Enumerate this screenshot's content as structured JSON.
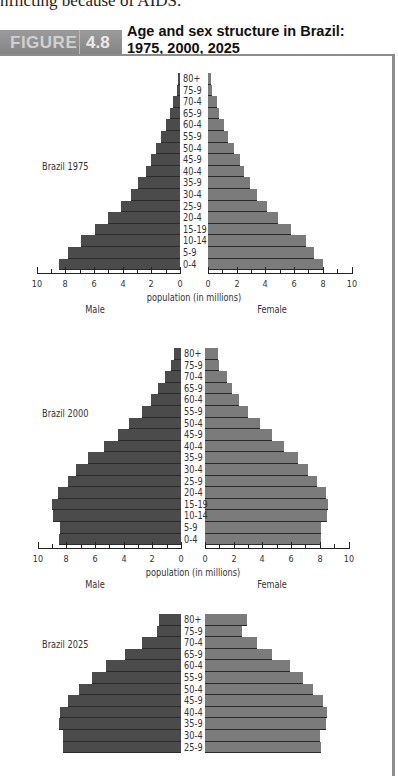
{
  "page": {
    "preceding_text": "nflicting because of AIDS."
  },
  "figure": {
    "tab_word": "FIGURE",
    "tab_number": "4.8",
    "title_line1": "Age and sex structure in Brazil:",
    "title_line2": "1975, 2000, 2025",
    "colors": {
      "male": "#4b4b4b",
      "female": "#7b7b7b",
      "frame": "#8c8c8c",
      "tab": "#8f8f8f"
    }
  },
  "axis": {
    "title": "population (in millions)",
    "male_label": "Male",
    "female_label": "Female",
    "male_ticks": [
      "10",
      "8",
      "6",
      "4",
      "2",
      "0"
    ],
    "female_ticks": [
      "0",
      "2",
      "4",
      "6",
      "8",
      "10"
    ]
  },
  "chart_data": [
    {
      "type": "bar",
      "orientation": "horizontal-population-pyramid",
      "title": "Brazil 1975",
      "xlabel": "population (in millions)",
      "ylabel": "age group",
      "xlim": [
        0,
        10
      ],
      "categories": [
        "80+",
        "75-9",
        "70-4",
        "65-9",
        "60-4",
        "55-9",
        "50-4",
        "45-9",
        "40-4",
        "35-9",
        "30-4",
        "25-9",
        "20-4",
        "15-19",
        "10-14",
        "5-9",
        "0-4"
      ],
      "series": [
        {
          "name": "Male",
          "values": [
            0.15,
            0.2,
            0.5,
            0.7,
            1.0,
            1.3,
            1.7,
            2.0,
            2.4,
            2.9,
            3.4,
            4.1,
            5.0,
            5.9,
            6.9,
            7.8,
            8.4
          ]
        },
        {
          "name": "Female",
          "values": [
            0.2,
            0.3,
            0.6,
            0.8,
            1.1,
            1.4,
            1.8,
            2.2,
            2.5,
            2.9,
            3.4,
            4.1,
            4.9,
            5.8,
            6.8,
            7.4,
            8.0
          ]
        }
      ]
    },
    {
      "type": "bar",
      "orientation": "horizontal-population-pyramid",
      "title": "Brazil 2000",
      "xlabel": "population (in millions)",
      "ylabel": "age group",
      "xlim": [
        0,
        10
      ],
      "categories": [
        "80+",
        "75-9",
        "70-4",
        "65-9",
        "60-4",
        "55-9",
        "50-4",
        "45-9",
        "40-4",
        "35-9",
        "30-4",
        "25-9",
        "20-4",
        "15-19",
        "10-14",
        "5-9",
        "0-4"
      ],
      "series": [
        {
          "name": "Male",
          "values": [
            0.5,
            0.7,
            1.1,
            1.6,
            2.1,
            2.7,
            3.6,
            4.4,
            5.4,
            6.5,
            7.3,
            7.9,
            8.6,
            9.0,
            8.9,
            8.4,
            8.5
          ]
        },
        {
          "name": "Female",
          "values": [
            0.9,
            1.0,
            1.5,
            1.9,
            2.4,
            3.0,
            3.8,
            4.7,
            5.5,
            6.5,
            7.2,
            7.8,
            8.4,
            8.6,
            8.5,
            8.1,
            8.1
          ]
        }
      ]
    },
    {
      "type": "bar",
      "orientation": "horizontal-population-pyramid",
      "title": "Brazil 2025",
      "xlabel": "population (in millions)",
      "ylabel": "age group",
      "xlim": [
        0,
        10
      ],
      "note": "visible portion only; rows below 25-9 are cut off",
      "categories": [
        "80+",
        "75-9",
        "70-4",
        "65-9",
        "60-4",
        "55-9",
        "50-4",
        "45-9",
        "40-4",
        "35-9",
        "30-4",
        "25-9"
      ],
      "series": [
        {
          "name": "Male",
          "values": [
            1.5,
            1.7,
            2.7,
            3.9,
            5.2,
            6.2,
            7.1,
            7.9,
            8.4,
            8.5,
            8.2,
            8.2
          ]
        },
        {
          "name": "Female",
          "values": [
            2.9,
            2.6,
            3.6,
            4.7,
            5.9,
            6.8,
            7.5,
            8.2,
            8.5,
            8.4,
            8.0,
            8.1
          ]
        }
      ]
    }
  ]
}
